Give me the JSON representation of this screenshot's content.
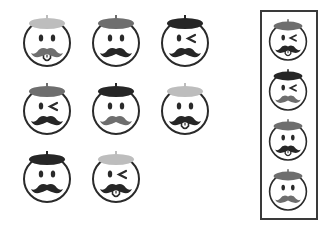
{
  "colors": {
    "light": "#bdbdbd",
    "medium": "#6e6e6e",
    "dark": "#262626",
    "outline": "#2a2a2a"
  },
  "puzzle": {
    "grid": [
      {
        "row": 1,
        "col": 1,
        "beret": "light",
        "eyes": "open",
        "mustache": "medium",
        "tongue": true
      },
      {
        "row": 1,
        "col": 2,
        "beret": "medium",
        "eyes": "open",
        "mustache": "dark",
        "tongue": false
      },
      {
        "row": 1,
        "col": 3,
        "beret": "dark",
        "eyes": "wink",
        "mustache": "dark",
        "tongue": false
      },
      {
        "row": 2,
        "col": 1,
        "beret": "medium",
        "eyes": "wink",
        "mustache": "dark",
        "tongue": false
      },
      {
        "row": 2,
        "col": 2,
        "beret": "dark",
        "eyes": "open",
        "mustache": "medium",
        "tongue": false
      },
      {
        "row": 2,
        "col": 3,
        "beret": "light",
        "eyes": "open",
        "mustache": "dark",
        "tongue": true
      },
      {
        "row": 3,
        "col": 1,
        "beret": "dark",
        "eyes": "open",
        "mustache": "dark",
        "tongue": false
      },
      {
        "row": 3,
        "col": 2,
        "beret": "light",
        "eyes": "wink",
        "mustache": "dark",
        "tongue": true
      }
    ],
    "options": [
      {
        "index": 1,
        "beret": "medium",
        "eyes": "wink",
        "mustache": "dark",
        "tongue": true
      },
      {
        "index": 2,
        "beret": "dark",
        "eyes": "wink",
        "mustache": "medium",
        "tongue": false
      },
      {
        "index": 3,
        "beret": "medium",
        "eyes": "open",
        "mustache": "dark",
        "tongue": true
      },
      {
        "index": 4,
        "beret": "medium",
        "eyes": "open",
        "mustache": "medium",
        "tongue": false
      }
    ]
  }
}
